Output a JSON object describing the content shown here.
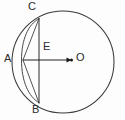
{
  "figure": {
    "background_color": "#fdfdfd",
    "stroke_color": "#2a2a2a",
    "labels": {
      "A": "A",
      "B": "B",
      "C": "C",
      "E": "E",
      "O": "O"
    },
    "points": {
      "A": {
        "x": 23,
        "y": 60
      },
      "B": {
        "x": 39,
        "y": 103
      },
      "C": {
        "x": 39,
        "y": 18
      },
      "E": {
        "x": 39,
        "y": 60
      },
      "O": {
        "x": 71,
        "y": 60
      }
    },
    "circle": {
      "center_x": 63,
      "center_y": 62,
      "radius": 51
    },
    "segments": [
      {
        "name": "segment-AC",
        "from": "A",
        "to": "C"
      },
      {
        "name": "segment-AB",
        "from": "A",
        "to": "B"
      },
      {
        "name": "chord-CB",
        "from": "C",
        "to": "B"
      },
      {
        "name": "radius-AO",
        "from": "A",
        "to": "O"
      }
    ],
    "arcs": [
      {
        "name": "arc-CAB",
        "description": "minor arc from C through A to B"
      }
    ],
    "markers": {
      "center_dot": "filled-dot-at-O",
      "arrow": "arrow-from-A-to-O"
    }
  }
}
